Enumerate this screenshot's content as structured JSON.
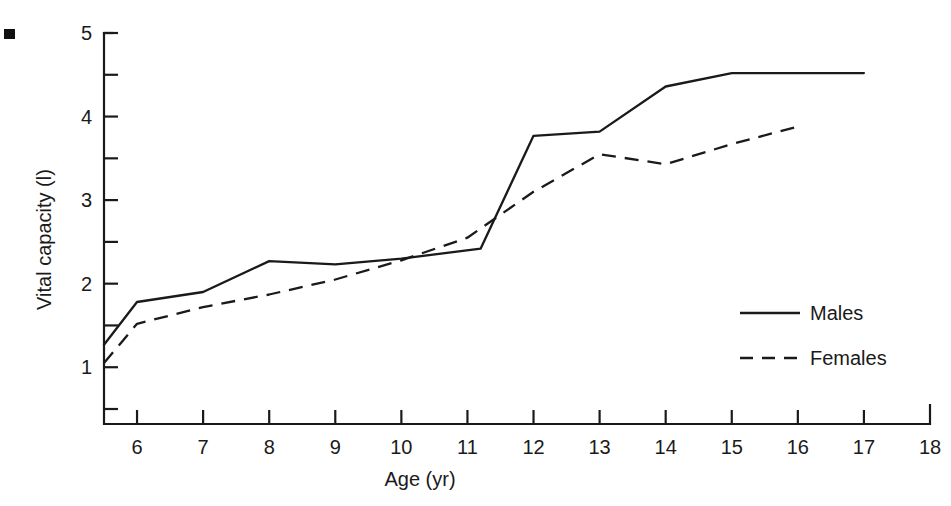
{
  "chart_data": {
    "type": "line",
    "title": "",
    "xlabel": "Age (yr)",
    "ylabel": "Vital capacity (l)",
    "xlim": [
      5.5,
      18
    ],
    "ylim": [
      0.3,
      5
    ],
    "grid": false,
    "legend_position": "center-right",
    "x_ticks": [
      6,
      7,
      8,
      9,
      10,
      11,
      12,
      13,
      14,
      15,
      16,
      17,
      18
    ],
    "x_tick_labels": [
      "6",
      "7",
      "8",
      "9",
      "10",
      "11",
      "12",
      "13",
      "14",
      "15",
      "16",
      "17",
      "18"
    ],
    "y_ticks": [
      0.5,
      1,
      1.5,
      2,
      2.5,
      3,
      3.5,
      4,
      4.5,
      5
    ],
    "y_tick_labels": [
      "",
      "1",
      "",
      "2",
      "",
      "3",
      "",
      "4",
      "",
      "5"
    ],
    "y_major_labels": [
      {
        "value": 5,
        "label": "5"
      },
      {
        "value": 4,
        "label": "4"
      },
      {
        "value": 3,
        "label": "3"
      },
      {
        "value": 2,
        "label": "2"
      },
      {
        "value": 1,
        "label": "1"
      }
    ],
    "series": [
      {
        "name": "Males",
        "style": "solid",
        "x": [
          5.5,
          6,
          7,
          8,
          9,
          10,
          11.2,
          12,
          13,
          14,
          15,
          17
        ],
        "values": [
          1.27,
          1.78,
          1.9,
          2.27,
          2.23,
          2.3,
          2.42,
          3.77,
          3.82,
          4.36,
          4.52,
          4.52
        ]
      },
      {
        "name": "Females",
        "style": "dashed",
        "x": [
          5.5,
          6,
          7,
          8,
          9,
          10,
          11,
          12,
          13,
          14,
          15,
          16
        ],
        "values": [
          1.05,
          1.52,
          1.72,
          1.87,
          2.05,
          2.28,
          2.55,
          3.1,
          3.55,
          3.43,
          3.67,
          3.88
        ]
      }
    ],
    "legend": [
      {
        "label": "Males",
        "style": "solid"
      },
      {
        "label": "Females",
        "style": "dashed"
      }
    ]
  },
  "colors": {
    "line": "#1a1a1a",
    "background": "#ffffff",
    "axis": "#1a1a1a"
  }
}
